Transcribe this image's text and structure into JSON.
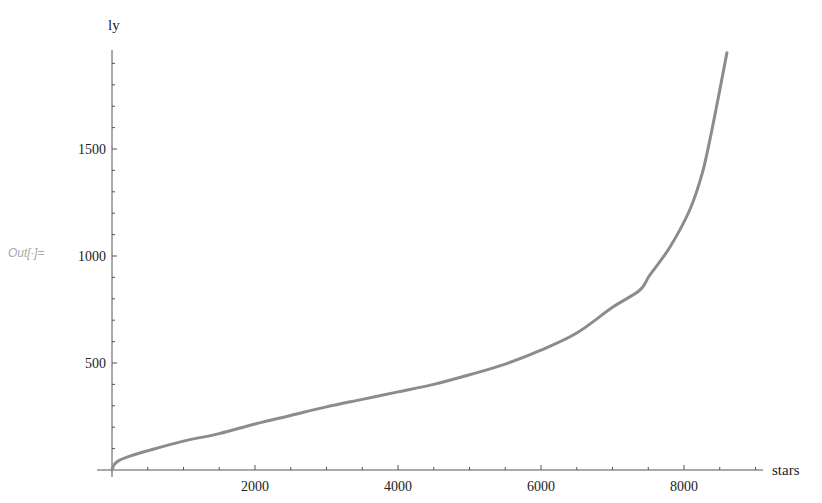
{
  "cell": {
    "out_label": "Out[∙]="
  },
  "chart_data": {
    "type": "line",
    "title": "",
    "xlabel": "stars",
    "ylabel": "ly",
    "xlim": [
      0,
      9100
    ],
    "ylim": [
      0,
      1950
    ],
    "grid": false,
    "legend": "none",
    "x_ticks": [
      2000,
      4000,
      6000,
      8000
    ],
    "y_ticks": [
      500,
      1000,
      1500
    ],
    "x_minor_step": 500,
    "y_minor_step": 100,
    "line_color": "#8c8c8c",
    "series": [
      {
        "name": "ly",
        "x": [
          0,
          30,
          100,
          250,
          500,
          1000,
          1500,
          2000,
          2500,
          3000,
          3500,
          4000,
          4500,
          5000,
          5500,
          6000,
          6500,
          7000,
          7380,
          7520,
          7800,
          8080,
          8250,
          8360,
          8500,
          8600
        ],
        "values": [
          0,
          25,
          45,
          65,
          90,
          135,
          170,
          215,
          255,
          295,
          330,
          365,
          400,
          445,
          495,
          560,
          640,
          760,
          840,
          910,
          1040,
          1215,
          1380,
          1540,
          1775,
          1950
        ]
      }
    ]
  }
}
